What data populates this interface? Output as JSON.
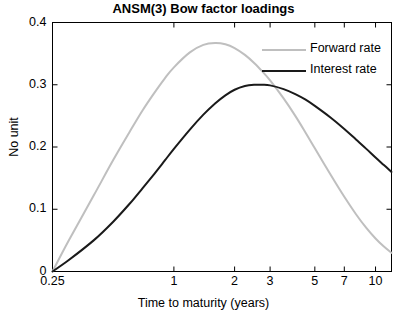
{
  "chart_data": {
    "type": "line",
    "title": "ANSM(3) Bow factor loadings",
    "xlabel": "Time to maturity (years)",
    "ylabel": "No unit",
    "xscale": "log",
    "xlim": [
      0.25,
      12
    ],
    "ylim": [
      0,
      0.4
    ],
    "grid": false,
    "legend_position": "top-right",
    "xticks": [
      0.25,
      1,
      2,
      3,
      5,
      7,
      10
    ],
    "xtick_labels": [
      "0.25",
      "1",
      "2",
      "3",
      "5",
      "7",
      "10"
    ],
    "yticks": [
      0,
      0.1,
      0.2,
      0.3,
      0.4
    ],
    "ytick_labels": [
      "0",
      "0.1",
      "0.2",
      "0.3",
      "0.4"
    ],
    "series": [
      {
        "name": "Forward rate",
        "color": "#bfbfbf",
        "x": [
          0.25,
          0.3,
          0.4,
          0.5,
          0.6,
          0.7,
          0.8,
          0.9,
          1.0,
          1.2,
          1.4,
          1.6,
          1.8,
          2.0,
          2.25,
          2.5,
          2.75,
          3.0,
          3.5,
          4.0,
          4.5,
          5.0,
          6.0,
          7.0,
          8.0,
          9.0,
          10.0,
          11.0,
          12.0
        ],
        "values": [
          0.0,
          0.049,
          0.122,
          0.179,
          0.223,
          0.259,
          0.287,
          0.31,
          0.328,
          0.352,
          0.364,
          0.367,
          0.365,
          0.359,
          0.348,
          0.335,
          0.321,
          0.307,
          0.278,
          0.25,
          0.223,
          0.198,
          0.155,
          0.12,
          0.092,
          0.07,
          0.053,
          0.04,
          0.03
        ]
      },
      {
        "name": "Interest rate",
        "color": "#1a1a1a",
        "x": [
          0.25,
          0.3,
          0.4,
          0.5,
          0.6,
          0.7,
          0.8,
          0.9,
          1.0,
          1.2,
          1.4,
          1.6,
          1.8,
          2.0,
          2.25,
          2.5,
          2.75,
          3.0,
          3.5,
          4.0,
          4.5,
          5.0,
          6.0,
          7.0,
          8.0,
          9.0,
          10.0,
          11.0,
          12.0
        ],
        "values": [
          0.0,
          0.018,
          0.05,
          0.08,
          0.108,
          0.134,
          0.157,
          0.178,
          0.197,
          0.228,
          0.252,
          0.27,
          0.283,
          0.292,
          0.298,
          0.3,
          0.3,
          0.299,
          0.293,
          0.285,
          0.276,
          0.266,
          0.247,
          0.229,
          0.212,
          0.197,
          0.183,
          0.171,
          0.16
        ]
      }
    ],
    "legend": [
      {
        "label": "Forward rate",
        "color": "#bfbfbf"
      },
      {
        "label": "Interest rate",
        "color": "#1a1a1a"
      }
    ]
  },
  "axes": {
    "box_color": "#000000"
  }
}
